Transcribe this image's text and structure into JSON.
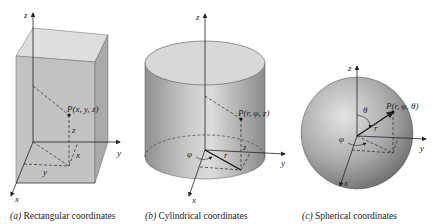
{
  "figures": [
    {
      "id": "a",
      "caption_letter": "(a)",
      "caption_text": " Rectangular coordinates",
      "point_label": "P(x, y, z)",
      "axes": {
        "x": "x",
        "y": "y",
        "z": "z"
      },
      "dims": {
        "x": "x",
        "y": "y",
        "z": "z"
      },
      "shape": "rectangular-box"
    },
    {
      "id": "b",
      "caption_letter": "(b)",
      "caption_text": " Cylindrical coordinates",
      "point_label": "P(r, φ, z)",
      "axes": {
        "x": "x",
        "y": "y",
        "z": "z"
      },
      "dims": {
        "r": "r",
        "phi": "φ",
        "z": "z"
      },
      "shape": "cylinder"
    },
    {
      "id": "c",
      "caption_letter": "(c)",
      "caption_text": " Spherical coordinates",
      "point_label": "P(r, φ, θ)",
      "axes": {
        "x": "x",
        "y": "y",
        "z": "z"
      },
      "dims": {
        "r": "r",
        "phi": "φ",
        "theta": "θ"
      },
      "shape": "sphere"
    }
  ],
  "colors": {
    "box_top": "#d9d9d9",
    "box_front": "#bdbdbd",
    "box_side": "#a8a8a8",
    "ink": "#222222"
  }
}
